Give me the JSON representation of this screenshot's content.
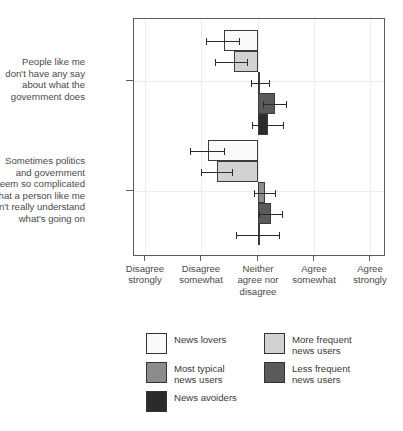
{
  "chart_data": {
    "type": "bar",
    "orientation": "horizontal",
    "title": "",
    "subtitle": "",
    "xlabel": "",
    "ylabel": "",
    "grid": true,
    "legend_position": "bottom",
    "xlim": [
      -2.2,
      2.2
    ],
    "x_tick_values": [
      -2,
      -1,
      0,
      1,
      2
    ],
    "x_tick_labels": [
      "Disagree\nstrongly",
      "Disagree\nsomewhat",
      "Neither\nagree nor\ndisagree",
      "Agree\nsomewhat",
      "Agree\nstrongly"
    ],
    "categories": [
      "People like me don't have any say about what the government does",
      "Sometimes politics and government seem so complicated that a person like me can't really understand what's going on"
    ],
    "category_label_lines": [
      [
        "People like me",
        "don't have any say",
        "about what the",
        "government does"
      ],
      [
        "Sometimes politics",
        "and government",
        "seem so complicated",
        "that a person like me",
        "can't really understand",
        "what's going on"
      ]
    ],
    "series": [
      {
        "name": "News lovers",
        "color": "#fafafa",
        "values": [
          -0.61,
          -0.89
        ],
        "ci_low": [
          -0.93,
          -1.2
        ],
        "ci_high": [
          -0.32,
          -0.58
        ]
      },
      {
        "name": "More frequent news users",
        "color": "#d2d2d2",
        "values": [
          -0.43,
          -0.73
        ],
        "ci_low": [
          -0.77,
          -1.02
        ],
        "ci_high": [
          -0.18,
          -0.45
        ]
      },
      {
        "name": "Most typical news users",
        "color": "#8c8c8c",
        "values": [
          0.04,
          0.12
        ],
        "ci_low": [
          -0.12,
          -0.07
        ],
        "ci_high": [
          0.21,
          0.32
        ]
      },
      {
        "name": "Less frequent news users",
        "color": "#5a5a5a",
        "values": [
          0.3,
          0.23
        ],
        "ci_low": [
          0.09,
          0.02
        ],
        "ci_high": [
          0.52,
          0.45
        ]
      },
      {
        "name": "News avoiders",
        "color": "#2b2b2b",
        "values": [
          0.18,
          0.01
        ],
        "ci_low": [
          -0.1,
          -0.39
        ],
        "ci_high": [
          0.46,
          0.39
        ]
      }
    ]
  },
  "legend": {
    "items": [
      {
        "label": "News lovers",
        "color": "#fafafa"
      },
      {
        "label": "More frequent\nnews users",
        "color": "#d2d2d2"
      },
      {
        "label": "Most typical\nnews users",
        "color": "#8c8c8c"
      },
      {
        "label": "Less frequent\nnews users",
        "color": "#5a5a5a"
      },
      {
        "label": "News avoiders",
        "color": "#2b2b2b"
      }
    ]
  },
  "axis": {
    "x_labels": [
      "Disagree\nstrongly",
      "Disagree\nsomewhat",
      "Neither\nagree nor\ndisagree",
      "Agree\nsomewhat",
      "Agree\nstrongly"
    ]
  }
}
